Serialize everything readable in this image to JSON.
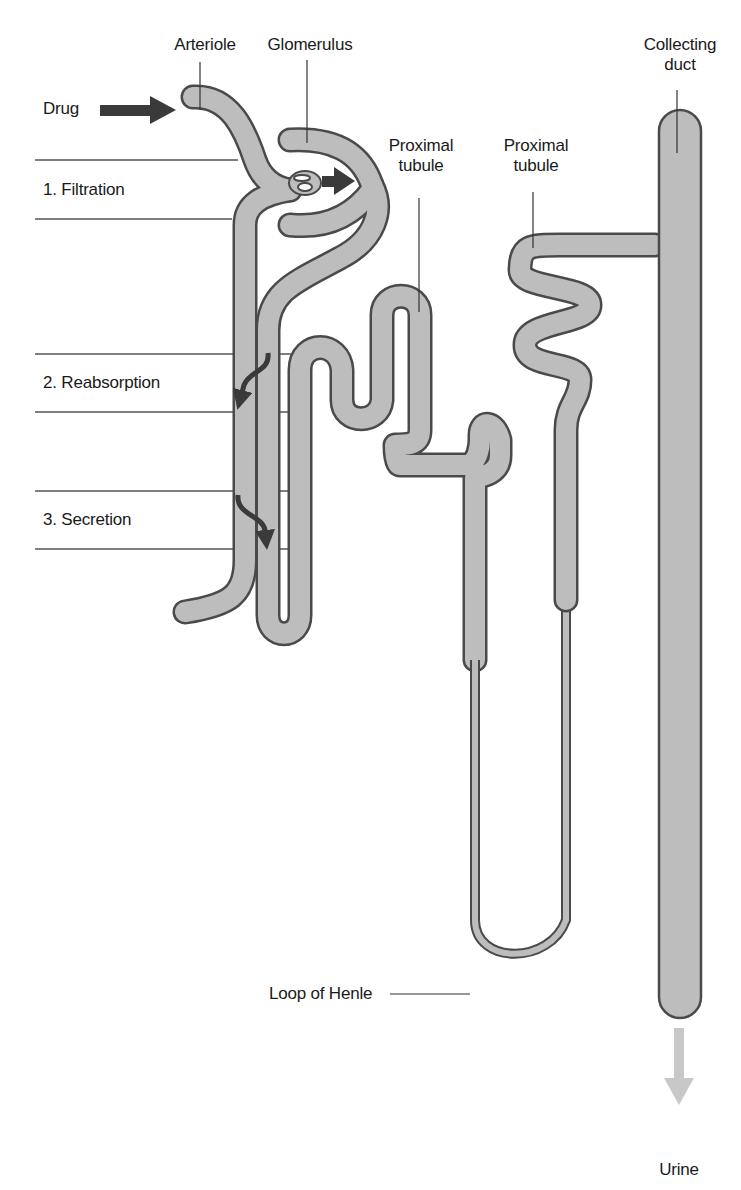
{
  "diagram": {
    "colors": {
      "tubule_fill": "#bdbdbd",
      "tubule_outline": "#4a4a4a",
      "arrow_dark": "#3a3a3a",
      "urine_arrow": "#c8c8c8",
      "text": "#1a1a1a"
    },
    "labels": {
      "drug": "Drug",
      "arteriole": "Arteriole",
      "glomerulus": "Glomerulus",
      "proximal_tubule_1_line1": "Proximal",
      "proximal_tubule_1_line2": "tubule",
      "proximal_tubule_2_line1": "Proximal",
      "proximal_tubule_2_line2": "tubule",
      "collecting_duct_line1": "Collecting",
      "collecting_duct_line2": "duct",
      "loop_of_henle": "Loop of Henle",
      "urine": "Urine"
    },
    "processes": [
      {
        "step": "1. Filtration"
      },
      {
        "step": "2. Reabsorption"
      },
      {
        "step": "3. Secretion"
      }
    ]
  }
}
